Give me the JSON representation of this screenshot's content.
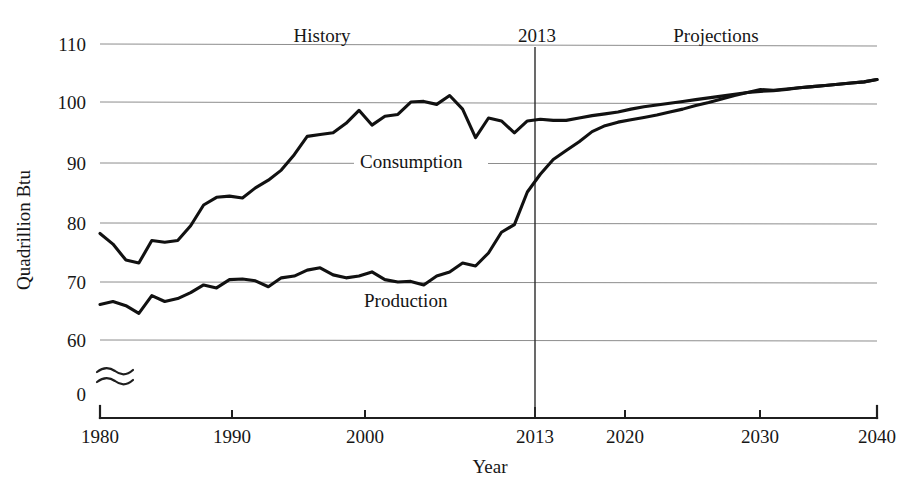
{
  "chart_data": {
    "type": "line",
    "title": "",
    "xlabel": "Year",
    "ylabel": "Quadrillion Btu",
    "xlim": [
      1980,
      2040
    ],
    "ylim": [
      55,
      113
    ],
    "grid": true,
    "legend_position": "inline-annotations",
    "x_ticks": [
      1980,
      1990,
      2000,
      2013,
      2020,
      2030,
      2040
    ],
    "x_tick_labels": [
      "1980",
      "1990",
      "2000",
      "2013",
      "2020",
      "2030",
      "2040"
    ],
    "y_ticks": [
      60,
      70,
      80,
      90,
      100,
      110
    ],
    "y_tick_labels": [
      "60",
      "70",
      "80",
      "90",
      "100",
      "110"
    ],
    "y_axis_break_label": "0",
    "y_axis_break_icon": "wave-break-icon",
    "annotations": [
      {
        "text": "History",
        "x": 1994,
        "y": 112,
        "name": "history-region-label"
      },
      {
        "text": "2013",
        "x": 2013,
        "y": 112,
        "name": "divider-year-label"
      },
      {
        "text": "Projections",
        "x": 2026,
        "y": 112,
        "name": "projections-region-label"
      },
      {
        "text": "Consumption",
        "x": 2000,
        "y": 92.5,
        "name": "consumption-series-label"
      },
      {
        "text": "Production",
        "x": 2000.5,
        "y": 68.0,
        "name": "production-series-label"
      }
    ],
    "divider_x": 2013,
    "series": [
      {
        "name": "Consumption",
        "color": "#111111",
        "x": [
          1980,
          1981,
          1982,
          1983,
          1984,
          1985,
          1986,
          1987,
          1988,
          1989,
          1990,
          1991,
          1992,
          1993,
          1994,
          1995,
          1996,
          1997,
          1998,
          1999,
          2000,
          2001,
          2002,
          2003,
          2004,
          2005,
          2006,
          2007,
          2008,
          2009,
          2010,
          2011,
          2012,
          2013,
          2014,
          2015,
          2016,
          2017,
          2018,
          2019,
          2020,
          2021,
          2022,
          2023,
          2024,
          2025,
          2026,
          2027,
          2028,
          2029,
          2030,
          2031,
          2032,
          2033,
          2034,
          2035,
          2036,
          2037,
          2038,
          2039,
          2040
        ],
        "values": [
          78.0,
          76.2,
          73.5,
          73.0,
          76.8,
          76.5,
          76.8,
          79.3,
          82.8,
          84.1,
          84.3,
          84.0,
          85.7,
          87.0,
          88.7,
          91.3,
          94.4,
          94.7,
          95.0,
          96.6,
          98.8,
          96.3,
          97.8,
          98.1,
          100.2,
          100.3,
          99.8,
          101.3,
          99.0,
          94.2,
          97.5,
          97.0,
          95.0,
          97.0,
          97.3,
          97.1,
          97.1,
          97.5,
          97.9,
          98.2,
          98.5,
          99.0,
          99.4,
          99.7,
          100.0,
          100.3,
          100.6,
          100.9,
          101.2,
          101.5,
          101.8,
          102.0,
          102.1,
          102.3,
          102.6,
          102.8,
          103.0,
          103.2,
          103.4,
          103.6,
          104.0
        ]
      },
      {
        "name": "Production",
        "color": "#111111",
        "x": [
          1980,
          1981,
          1982,
          1983,
          1984,
          1985,
          1986,
          1987,
          1988,
          1989,
          1990,
          1991,
          1992,
          1993,
          1994,
          1995,
          1996,
          1997,
          1998,
          1999,
          2000,
          2001,
          2002,
          2003,
          2004,
          2005,
          2006,
          2007,
          2008,
          2009,
          2010,
          2011,
          2012,
          2013,
          2014,
          2015,
          2016,
          2017,
          2018,
          2019,
          2020,
          2021,
          2022,
          2023,
          2024,
          2025,
          2026,
          2027,
          2028,
          2029,
          2030,
          2031,
          2032,
          2033,
          2034,
          2035,
          2036,
          2037,
          2038,
          2039,
          2040
        ],
        "values": [
          66.0,
          66.5,
          65.8,
          64.5,
          67.5,
          66.5,
          67.0,
          68.0,
          69.3,
          68.8,
          70.2,
          70.3,
          70.0,
          69.0,
          70.5,
          70.8,
          71.8,
          72.2,
          71.0,
          70.5,
          70.8,
          71.5,
          70.2,
          69.8,
          69.9,
          69.3,
          70.8,
          71.5,
          73.0,
          72.5,
          74.7,
          78.2,
          79.5,
          85.0,
          88.0,
          90.5,
          92.0,
          93.5,
          95.2,
          96.2,
          96.8,
          97.2,
          97.6,
          98.0,
          98.5,
          99.0,
          99.6,
          100.1,
          100.7,
          101.3,
          101.8,
          102.3,
          102.2,
          102.4,
          102.6,
          102.8,
          103.0,
          103.2,
          103.4,
          103.6,
          104.0
        ]
      }
    ]
  }
}
